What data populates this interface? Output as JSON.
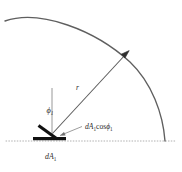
{
  "figure": {
    "background_color": "#ffffff",
    "width": 182,
    "height": 172
  },
  "colors": {
    "arc": "#5f5f5f",
    "ray": "#5a5a5a",
    "baseline_dotted": "#b0b0b0",
    "surface_element": "#111111",
    "normal_line": "#7a7a7a",
    "leader_line": "#8a8a8a",
    "text": "#2b2b2b"
  },
  "labels": {
    "angle": {
      "base": "ϕ",
      "subscript": "1",
      "full": "ϕ₁"
    },
    "radius": {
      "base": "r",
      "full": "r"
    },
    "projected_area": {
      "prefix": "d",
      "area_symbol": "A",
      "area_subscript": "1",
      "cos": "cos",
      "angle_symbol": "ϕ",
      "angle_subscript": "1",
      "full": "dA₁cosϕ₁"
    },
    "surface_area": {
      "prefix": "d",
      "area_symbol": "A",
      "area_subscript": "1",
      "full": "dA₁"
    }
  },
  "geometry": {
    "arc": {
      "start_x": 5,
      "start_y": 21,
      "apex_x": 62,
      "apex_y": 13,
      "end_x": 165,
      "end_y": 141
    },
    "baseline": {
      "y": 141,
      "x_start": 6,
      "x_end": 176,
      "style": "dotted"
    },
    "vertex": {
      "x": 52,
      "y": 134
    },
    "arrow_tip": {
      "x": 128,
      "y": 52
    },
    "normal_top": {
      "x": 52,
      "y": 88
    },
    "surface_bar": {
      "x1": 33,
      "y1": 138,
      "x2": 66,
      "y2": 138
    },
    "tilted_bar": {
      "x1": 38,
      "y1": 126,
      "x2": 57,
      "y2": 139
    }
  }
}
